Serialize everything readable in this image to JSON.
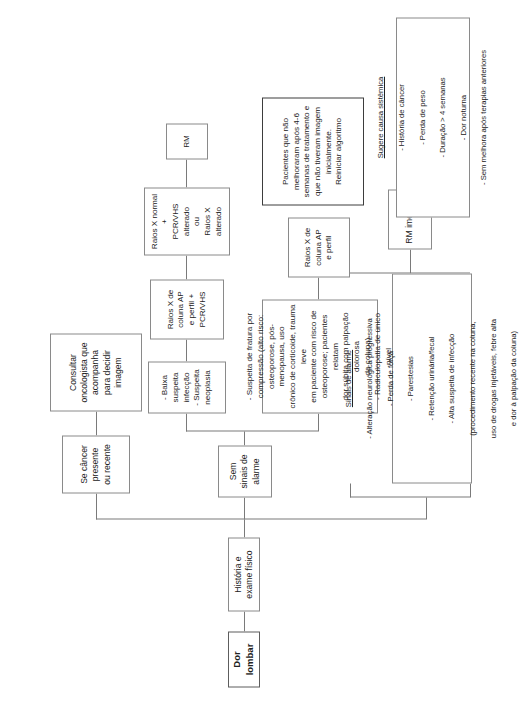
{
  "diagram": {
    "title": "Dor lombar",
    "language": "pt-BR",
    "orientation": "rotated-90-ccw"
  },
  "nodes": {
    "root": "Dor lombar",
    "history": "História e exame físico",
    "alarm_signs_header": "Sinais de alarme",
    "no_alarm_signs": "Sem sinais de alarme",
    "cancer_branch": "Se câncer presente\nou recente",
    "oncologist": "Consultar\noncologista que\nacompanha\npara decidir\nimagem",
    "low_suspicion": "- Baixa suspeita infecção\n- Suspeita neoplasia",
    "xray_pcr": "Raios X de coluna AP\ne perfil + PCR/VHS",
    "xray_abnormal": "Raios X normal +\nPCR/VHS alterado\nou\nRaios X alterado",
    "mri": "RM",
    "fracture_suspicion": "- Suspeita de fratura por\ncompressão (alto risco:\nosteoporose, pós-menopausa, uso\ncrônico de corticoide, trauma leve\nem paciente com risco de\nosteoporose; pacientes relatam\ndor súbita com palpação dolorosa\nda coluna)\n- Radiculopatia de único nível",
    "xray_ap": "Raios X de coluna AP\ne perfil",
    "mri_immediate": "RM imediata",
    "reinit_note": "Pacientes que não\nmelhoraram após 4-6\nsemanas de tratamento e\nque não tiveram imagem\ninicialmente.\nReiniciar algoritmo"
  },
  "alarm_signs_panel": {
    "header": "Sinais de alarme",
    "items": [
      "- Alteração neurológica progressiva",
      "- Perda de força",
      "- Parestesias",
      "- Retenção urinária/fecal",
      "- Alta suspeita de infecção",
      "(procedimento recente na coluna,",
      "uso de drogas injetáveis, febre alta",
      "e dor à palpação da coluna)"
    ]
  },
  "systemic_panel": {
    "header": "Sugere causa sistêmica",
    "items": [
      "- História de câncer",
      "- Perda de peso",
      "- Duração > 4 semanas",
      "- Dor noturna",
      "- Sem melhora após terapias anteriores"
    ]
  }
}
